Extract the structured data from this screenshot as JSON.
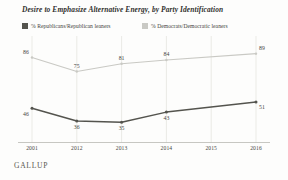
{
  "title": "Desire to Emphasize Alternative Energy, by Party Identification",
  "brand": "GALLUP",
  "legend": {
    "republican": {
      "label": "% Republicans/Republican leaners",
      "swatch_name": "legend-swatch-republican",
      "color": "#54544e"
    },
    "democrat": {
      "label": "% Democrats/Democratic leaners",
      "swatch_name": "legend-swatch-democrat",
      "color": "#c9c9c4"
    }
  },
  "chart_data": {
    "type": "line",
    "title": "Desire to Emphasize Alternative Energy, by Party Identification",
    "xlabel": "",
    "ylabel": "",
    "ylim": [
      25,
      95
    ],
    "grid": "vertical",
    "legend_position": "top",
    "categories": [
      "2001",
      "2012",
      "2013",
      "2014",
      "2015",
      "2016"
    ],
    "tick_labels": [
      "2001",
      "2012",
      "2013",
      "2014",
      "2015",
      "2016"
    ],
    "series": [
      {
        "name": "% Republicans/Republican leaners",
        "color": "#54544e",
        "values": [
          46,
          36,
          35,
          43,
          null,
          51
        ],
        "point_labels": [
          "46",
          "36",
          "35",
          "43",
          "",
          "51"
        ]
      },
      {
        "name": "% Democrats/Democratic leaners",
        "color": "#c9c9c4",
        "values": [
          86,
          75,
          81,
          84,
          null,
          89
        ],
        "point_labels": [
          "86",
          "75",
          "81",
          "84",
          "",
          "89"
        ]
      }
    ]
  }
}
